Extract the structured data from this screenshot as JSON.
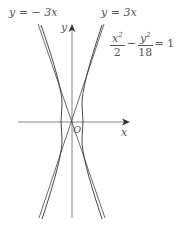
{
  "diagram": {
    "labels": {
      "asymptote_neg": "y = − 3x",
      "asymptote_pos": "y = 3x",
      "y_axis": "y",
      "x_axis": "x",
      "origin": "O"
    },
    "equation": {
      "term1_num": "x",
      "term1_exp": "2",
      "term1_den": "2",
      "minus": "−",
      "term2_num": "y",
      "term2_exp": "2",
      "term2_den": "18",
      "rhs": "= 1"
    },
    "colors": {
      "stroke": "#444444",
      "text": "#555555"
    }
  }
}
